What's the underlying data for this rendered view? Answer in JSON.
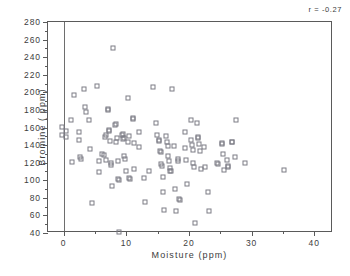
{
  "chart_data": {
    "type": "scatter",
    "title": "",
    "xlabel": "Moisture (ppm)",
    "ylabel": "Bromine ( ppm)",
    "xlim": [
      -2.5,
      43
    ],
    "ylim": [
      40,
      280
    ],
    "xticks": [
      0,
      10,
      20,
      30,
      40
    ],
    "xticks_minor": [
      5,
      15,
      25,
      35
    ],
    "yticks": [
      40,
      60,
      80,
      100,
      120,
      140,
      160,
      180,
      200,
      220,
      240,
      260,
      280
    ],
    "grid": false,
    "legend": null,
    "marker": "open-square",
    "marker_color": "#7d7d85",
    "annotations": [
      {
        "name": "correlation",
        "text": "r = -0.27"
      }
    ],
    "reference_lines": [
      {
        "name": "zero-moisture-line",
        "axis": "x",
        "value": 0
      }
    ],
    "series": [
      {
        "name": "samples",
        "points": [
          [
            -0.2,
            161
          ],
          [
            -0.2,
            151
          ],
          [
            0.3,
            156
          ],
          [
            0.4,
            149
          ],
          [
            1.2,
            168
          ],
          [
            1.3,
            121
          ],
          [
            1.7,
            197
          ],
          [
            2.4,
            155
          ],
          [
            2.5,
            146
          ],
          [
            2.6,
            126
          ],
          [
            2.7,
            124
          ],
          [
            3.3,
            204
          ],
          [
            3.4,
            183
          ],
          [
            3.5,
            178
          ],
          [
            4.0,
            169
          ],
          [
            4.2,
            135
          ],
          [
            4.6,
            74
          ],
          [
            5.4,
            207
          ],
          [
            5.6,
            122
          ],
          [
            5.7,
            109
          ],
          [
            6.2,
            130
          ],
          [
            6.4,
            129
          ],
          [
            6.6,
            149
          ],
          [
            6.7,
            152
          ],
          [
            6.8,
            123
          ],
          [
            7.0,
            180
          ],
          [
            7.1,
            181
          ],
          [
            7.2,
            156
          ],
          [
            7.3,
            157
          ],
          [
            7.4,
            145
          ],
          [
            7.5,
            120
          ],
          [
            7.6,
            117
          ],
          [
            7.7,
            94
          ],
          [
            7.9,
            250
          ],
          [
            8.2,
            163
          ],
          [
            8.3,
            164
          ],
          [
            8.4,
            143
          ],
          [
            8.5,
            148
          ],
          [
            8.6,
            122
          ],
          [
            8.7,
            101
          ],
          [
            8.8,
            100
          ],
          [
            8.9,
            41
          ],
          [
            9.3,
            151
          ],
          [
            9.4,
            153
          ],
          [
            9.5,
            147
          ],
          [
            9.6,
            148
          ],
          [
            9.7,
            128
          ],
          [
            9.8,
            124
          ],
          [
            9.9,
            110
          ],
          [
            10.2,
            194
          ],
          [
            10.3,
            143
          ],
          [
            10.4,
            150
          ],
          [
            10.5,
            102
          ],
          [
            10.6,
            101
          ],
          [
            11.0,
            171
          ],
          [
            11.1,
            170
          ],
          [
            11.2,
            142
          ],
          [
            11.3,
            113
          ],
          [
            12.0,
            155
          ],
          [
            12.1,
            138
          ],
          [
            12.9,
            103
          ],
          [
            13.0,
            75
          ],
          [
            13.6,
            111
          ],
          [
            14.2,
            206
          ],
          [
            14.7,
            165
          ],
          [
            14.9,
            151
          ],
          [
            15.2,
            145
          ],
          [
            15.3,
            146
          ],
          [
            15.4,
            133
          ],
          [
            15.5,
            132
          ],
          [
            15.6,
            118
          ],
          [
            15.7,
            116
          ],
          [
            15.8,
            104
          ],
          [
            15.9,
            87
          ],
          [
            16.0,
            66
          ],
          [
            16.4,
            150
          ],
          [
            16.5,
            143
          ],
          [
            16.6,
            139
          ],
          [
            16.7,
            128
          ],
          [
            16.8,
            122
          ],
          [
            16.9,
            114
          ],
          [
            17.0,
            111
          ],
          [
            17.1,
            110
          ],
          [
            17.3,
            204
          ],
          [
            17.6,
            139
          ],
          [
            17.8,
            90
          ],
          [
            17.9,
            65
          ],
          [
            18.2,
            124
          ],
          [
            18.3,
            122
          ],
          [
            18.4,
            79
          ],
          [
            18.5,
            78
          ],
          [
            19.3,
            155
          ],
          [
            19.4,
            137
          ],
          [
            19.6,
            123
          ],
          [
            19.7,
            96
          ],
          [
            20.3,
            168
          ],
          [
            20.4,
            146
          ],
          [
            20.5,
            140
          ],
          [
            20.6,
            134
          ],
          [
            20.7,
            120
          ],
          [
            20.8,
            115
          ],
          [
            20.9,
            51
          ],
          [
            21.3,
            165
          ],
          [
            21.4,
            149
          ],
          [
            21.5,
            148
          ],
          [
            21.6,
            141
          ],
          [
            21.8,
            133
          ],
          [
            21.9,
            113
          ],
          [
            22.4,
            138
          ],
          [
            22.5,
            115
          ],
          [
            23.0,
            87
          ],
          [
            23.2,
            65
          ],
          [
            24.5,
            120
          ],
          [
            24.7,
            119
          ],
          [
            25.2,
            141
          ],
          [
            25.3,
            142
          ],
          [
            25.4,
            130
          ],
          [
            25.6,
            112
          ],
          [
            26.0,
            123
          ],
          [
            26.2,
            116
          ],
          [
            26.3,
            115
          ],
          [
            26.8,
            144
          ],
          [
            26.9,
            143
          ],
          [
            27.3,
            126
          ],
          [
            27.5,
            169
          ],
          [
            28.9,
            120
          ],
          [
            35.2,
            112
          ]
        ]
      }
    ]
  }
}
